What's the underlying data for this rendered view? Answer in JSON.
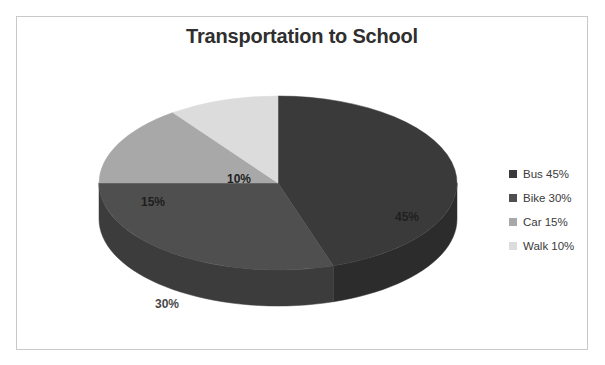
{
  "scan": {
    "top_sliver_text": "· · · · ·"
  },
  "chart_data": {
    "type": "pie",
    "title": "Transportation to School",
    "xlabel": "",
    "ylabel": "",
    "categories": [
      "Bus",
      "Bike",
      "Car",
      "Walk"
    ],
    "values": [
      45,
      30,
      15,
      10
    ],
    "unit": "%",
    "three_d": true,
    "start_angle_deg": 0,
    "direction": "clockwise",
    "grid": false,
    "legend_position": "right",
    "slices": [
      {
        "name": "Bus",
        "value": 45,
        "data_label": "45%",
        "legend_label": "Bus 45%",
        "color": "#3a3a3a",
        "side_color": "#2c2c2c",
        "label_x": 390,
        "label_y": 150,
        "label_on_dark": true
      },
      {
        "name": "Bike",
        "value": 30,
        "data_label": "30%",
        "legend_label": "Bike 30%",
        "color": "#4f4f4f",
        "side_color": "#3c3c3c",
        "label_x": 150,
        "label_y": 237,
        "label_on_dark": true
      },
      {
        "name": "Car",
        "value": 15,
        "data_label": "15%",
        "legend_label": "Car 15%",
        "color": "#a8a8a8",
        "side_color": "#868686",
        "label_x": 136,
        "label_y": 135,
        "label_on_dark": false
      },
      {
        "name": "Walk",
        "value": 10,
        "data_label": "10%",
        "legend_label": "Walk 10%",
        "color": "#dcdcdc",
        "side_color": "#b4b4b4",
        "label_x": 222,
        "label_y": 112,
        "label_on_dark": false
      }
    ]
  },
  "legend": {
    "items": [
      {
        "label": "Bus 45%",
        "color": "#3a3a3a"
      },
      {
        "label": "Bike 30%",
        "color": "#4f4f4f"
      },
      {
        "label": "Car 15%",
        "color": "#a8a8a8"
      },
      {
        "label": "Walk 10%",
        "color": "#dcdcdc"
      }
    ]
  },
  "style": {
    "frame_border": "#c9c9c9",
    "title_color": "#2f2f2f",
    "background": "#ffffff"
  }
}
